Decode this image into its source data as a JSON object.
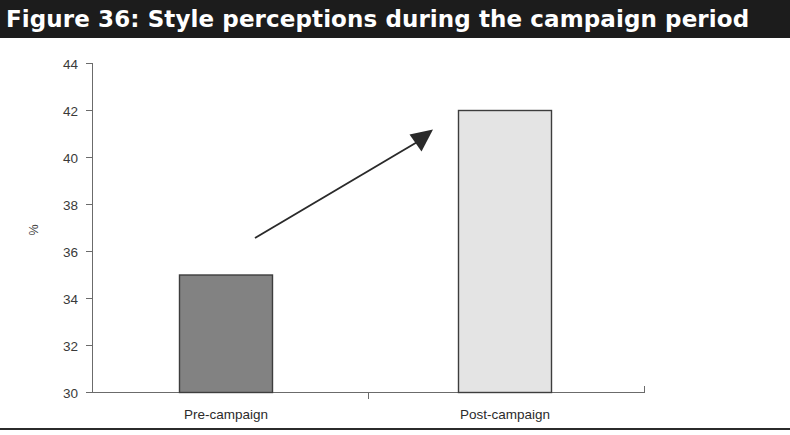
{
  "figure": {
    "title": "Figure 36: Style perceptions during the campaign period",
    "banner_color": "#1c1c1c",
    "banner_text_color": "#ffffff",
    "background": "#ffffff",
    "bottom_rule_color": "#2b2b2b"
  },
  "chart_data": {
    "type": "bar",
    "title": "Figure 36: Style perceptions during the campaign period",
    "categories": [
      "Pre-campaign",
      "Post-campaign"
    ],
    "values": [
      35,
      42
    ],
    "xlabel": "",
    "ylabel": "%",
    "ylim": [
      30,
      44
    ],
    "ytick_step": 2,
    "yticks": [
      30,
      32,
      34,
      36,
      38,
      40,
      42,
      44
    ],
    "ytick_labels": [
      "30",
      "32",
      "34",
      "36",
      "38",
      "40",
      "42",
      "44"
    ],
    "grid": false,
    "legend": false,
    "bar_colors": [
      "#828282",
      "#e4e4e4"
    ],
    "bar_edge_color": "#3d3d3d",
    "annotations": [
      {
        "kind": "arrow",
        "label": "upward-trend-arrow",
        "from_value": 36.1,
        "to_value": 40.6,
        "color": "#2a2a2a"
      }
    ]
  },
  "axis": {
    "y_title": "%",
    "tick_labels": [
      "44",
      "42",
      "40",
      "38",
      "36",
      "34",
      "32",
      "30"
    ],
    "category_labels": [
      "Pre-campaign",
      "Post-campaign"
    ]
  }
}
